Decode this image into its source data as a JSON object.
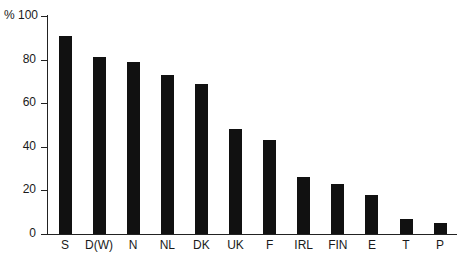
{
  "chart_data": {
    "type": "bar",
    "title": "",
    "xlabel": "",
    "ylabel": "%",
    "ylim": [
      0,
      100
    ],
    "yticks": [
      0,
      20,
      40,
      60,
      80,
      100
    ],
    "ytick_labels": [
      "0",
      "20",
      "40",
      "60",
      "80",
      "% 100"
    ],
    "grid": false,
    "legend": null,
    "categories": [
      "S",
      "D(W)",
      "N",
      "NL",
      "DK",
      "UK",
      "F",
      "IRL",
      "FIN",
      "E",
      "T",
      "P"
    ],
    "values": [
      91,
      81,
      79,
      73,
      69,
      48,
      43,
      26,
      23,
      18,
      7,
      5
    ],
    "bar_color": "#111111"
  }
}
